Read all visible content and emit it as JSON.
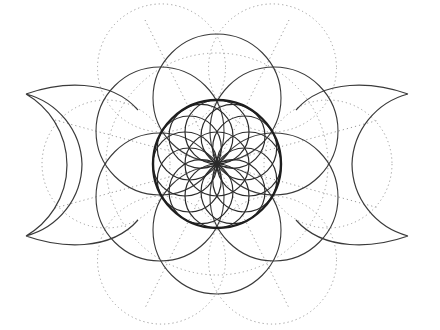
{
  "figure": {
    "colors": {
      "background": "#ffffff",
      "solid_line": "#3a3a3a",
      "thick_line": "#1e1e1e",
      "dotted_line": "#9a9a9a"
    },
    "center": [
      217,
      164
    ],
    "elements": {
      "thick_circle": {
        "r": 64
      },
      "seed_of_life": {
        "count": 7,
        "r": 32
      },
      "outer_solid_circles": {
        "count": 6,
        "r": 64,
        "distance": 64
      },
      "outer_dotted_circles": {
        "count": 6,
        "r": 64,
        "distance": 111
      },
      "left_crescent": {
        "tips": [
          [
            26,
            94
          ],
          [
            26,
            236
          ]
        ]
      },
      "right_crescent": {
        "tips": [
          [
            408,
            94
          ],
          [
            408,
            236
          ]
        ]
      }
    }
  }
}
